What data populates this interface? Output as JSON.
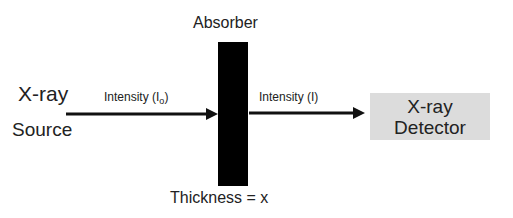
{
  "diagram": {
    "source": {
      "line1": "X-ray",
      "line2": "Source"
    },
    "absorber": {
      "label": "Absorber",
      "thickness_label": "Thickness = x"
    },
    "incident_beam": {
      "label": "Intensity (I",
      "subscript": "o",
      "close": ")"
    },
    "transmitted_beam": {
      "label": "Intensity (I)"
    },
    "detector": {
      "line1": "X-ray",
      "line2": "Detector"
    },
    "colors": {
      "absorber": "#000000",
      "detector_fill": "#dcdcdc",
      "arrow": "#111111"
    }
  }
}
